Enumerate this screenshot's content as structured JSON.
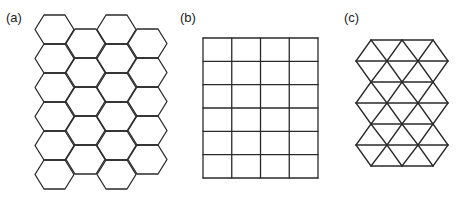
{
  "figure": {
    "panels": [
      {
        "label": "(a)",
        "shape": "hexagonal-lattice",
        "label_pos": [
          6,
          10
        ],
        "hex": {
          "columns": [
            {
              "left_x": 35,
              "top_y": 15,
              "count": 6
            },
            {
              "left_x": 66,
              "top_y": 29,
              "count": 5
            },
            {
              "left_x": 97,
              "top_y": 15,
              "count": 6
            },
            {
              "left_x": 128,
              "top_y": 29,
              "count": 5
            }
          ],
          "width": 39,
          "height": 29,
          "inset": 9
        }
      },
      {
        "label": "(b)",
        "shape": "square-lattice",
        "label_pos": [
          180,
          10
        ],
        "grid": {
          "x0": 203,
          "y0": 38,
          "x1": 318,
          "y1": 178,
          "cols": 4,
          "rows": 6
        }
      },
      {
        "label": "(c)",
        "shape": "triangular-lattice",
        "label_pos": [
          344,
          10
        ],
        "tri": {
          "rows_y": [
            40,
            61,
            82,
            103,
            124,
            145,
            166
          ],
          "even_x": [
            371,
            402,
            433
          ],
          "odd_x": [
            356,
            387,
            418,
            448
          ]
        }
      }
    ],
    "colors": {
      "line": "#2a2a2a",
      "background": "#ffffff"
    }
  }
}
